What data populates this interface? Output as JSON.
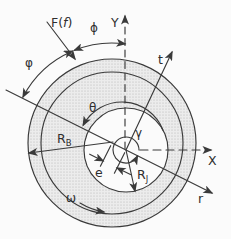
{
  "diagram": {
    "kind": "journal-bearing-geometry-figure",
    "labels": {
      "force_prefix": "F(",
      "force_arg": "f",
      "force_suffix": ")",
      "phi": "ϕ",
      "varphi": "φ",
      "axis_y": "Y",
      "axis_x": "X",
      "axis_t": "t",
      "axis_r": "r",
      "theta": "θ",
      "gamma": "γ",
      "eccentricity": "e",
      "omega": "ω",
      "bearing_radius_base": "R",
      "bearing_radius_sub": "B",
      "journal_radius_base": "R",
      "journal_radius_sub": "J"
    },
    "colors": {
      "stroke": "#3a3a3a",
      "stipple_bg": "#ececec",
      "stipple_dot": "#b0b0b0",
      "background": "#fbfbfb"
    }
  }
}
